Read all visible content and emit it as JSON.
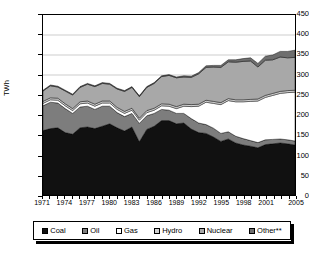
{
  "chart_data": {
    "type": "area",
    "stacked": true,
    "title": "",
    "xlabel": "",
    "ylabel": "TWh",
    "ylim": [
      0,
      450
    ],
    "ytick_step": 50,
    "yticks": [
      450,
      400,
      350,
      300,
      250,
      200,
      150,
      100,
      50,
      0
    ],
    "grid": true,
    "legend_position": "bottom",
    "x": [
      1971,
      1972,
      1973,
      1974,
      1975,
      1976,
      1977,
      1978,
      1979,
      1980,
      1981,
      1982,
      1983,
      1984,
      1985,
      1986,
      1987,
      1988,
      1989,
      1990,
      1991,
      1992,
      1993,
      1994,
      1995,
      1996,
      1997,
      1998,
      1999,
      2000,
      2001,
      2002,
      2003,
      2004,
      2005
    ],
    "xtick_labels": [
      "1971",
      "1974",
      "1977",
      "1980",
      "1983",
      "1986",
      "1989",
      "1992",
      "1995",
      "1998",
      "2001",
      "2005"
    ],
    "series": [
      {
        "name": "Coal",
        "color": "#111111",
        "values": [
          161,
          166,
          168,
          156,
          152,
          168,
          170,
          166,
          172,
          178,
          168,
          160,
          170,
          133,
          164,
          172,
          186,
          186,
          178,
          180,
          165,
          156,
          154,
          145,
          134,
          140,
          130,
          125,
          122,
          118,
          126,
          128,
          130,
          128,
          125
        ]
      },
      {
        "name": "Oil",
        "color": "#7d7d7d",
        "values": [
          62,
          66,
          62,
          60,
          52,
          52,
          52,
          48,
          50,
          44,
          38,
          36,
          34,
          46,
          34,
          32,
          28,
          26,
          26,
          24,
          26,
          24,
          22,
          22,
          20,
          18,
          17,
          16,
          14,
          13,
          12,
          11,
          10,
          10,
          10
        ]
      },
      {
        "name": "Gas",
        "color": "#ffffff",
        "values": [
          6,
          6,
          7,
          7,
          7,
          8,
          8,
          8,
          8,
          8,
          8,
          8,
          8,
          8,
          8,
          8,
          9,
          10,
          12,
          18,
          30,
          42,
          56,
          62,
          72,
          78,
          86,
          92,
          98,
          104,
          106,
          110,
          114,
          118,
          122
        ]
      },
      {
        "name": "Hydro",
        "color": "#d2d2d2",
        "values": [
          5,
          5,
          5,
          5,
          5,
          5,
          5,
          5,
          5,
          5,
          5,
          5,
          5,
          5,
          5,
          5,
          5,
          5,
          5,
          5,
          5,
          5,
          5,
          5,
          5,
          5,
          5,
          5,
          5,
          5,
          5,
          5,
          5,
          5,
          5
        ]
      },
      {
        "name": "Nuclear",
        "color": "#a8a8a8",
        "values": [
          26,
          30,
          28,
          32,
          34,
          36,
          42,
          44,
          44,
          42,
          46,
          50,
          52,
          54,
          58,
          62,
          68,
          72,
          72,
          68,
          68,
          76,
          82,
          86,
          88,
          92,
          94,
          96,
          96,
          80,
          88,
          84,
          86,
          82,
          82
        ]
      },
      {
        "name": "Other**",
        "color": "#6e6e6e",
        "values": [
          2,
          2,
          2,
          2,
          2,
          2,
          2,
          2,
          2,
          2,
          2,
          2,
          2,
          2,
          2,
          2,
          2,
          2,
          2,
          3,
          3,
          3,
          4,
          4,
          5,
          5,
          6,
          7,
          8,
          9,
          10,
          12,
          14,
          16,
          18
        ]
      }
    ]
  },
  "legend": {
    "items": [
      {
        "label": "Coal",
        "color": "#111111"
      },
      {
        "label": "Oil",
        "color": "#7d7d7d"
      },
      {
        "label": "Gas",
        "color": "#ffffff"
      },
      {
        "label": "Hydro",
        "color": "#d2d2d2"
      },
      {
        "label": "Nuclear",
        "color": "#a8a8a8"
      },
      {
        "label": "Other**",
        "color": "#6e6e6e"
      }
    ]
  }
}
